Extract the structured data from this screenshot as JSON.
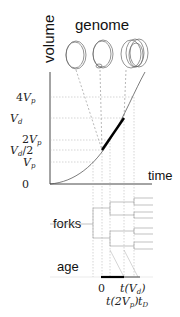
{
  "labels": {
    "volume_axis": "volume",
    "genome": "genome",
    "time_axis": "time",
    "forks": "forks",
    "age": "age"
  },
  "volume_ticks": [
    {
      "id": "4vp",
      "label": "4V",
      "sub": "p"
    },
    {
      "id": "vd",
      "label": "V",
      "sub": "d"
    },
    {
      "id": "2vp",
      "label": "2V",
      "sub": "p"
    },
    {
      "id": "vd2",
      "label": "V",
      "sub": "d",
      "suffix": "/2"
    },
    {
      "id": "vp",
      "label": "V",
      "sub": "p"
    },
    {
      "id": "zero",
      "label": "0"
    }
  ],
  "age_ticks": {
    "zero": "0",
    "t_vd": "t(V",
    "t_vd_sub": "d",
    "t_vd_close": ")",
    "t_2vp": "t(2V",
    "t_2vp_sub": "p",
    "t_2vp_close": ")",
    "t_D": "t",
    "t_D_sub": "D"
  },
  "genome_states": [
    "single chromosome",
    "replicating chromosome",
    "multiple replicating chromosomes"
  ]
}
